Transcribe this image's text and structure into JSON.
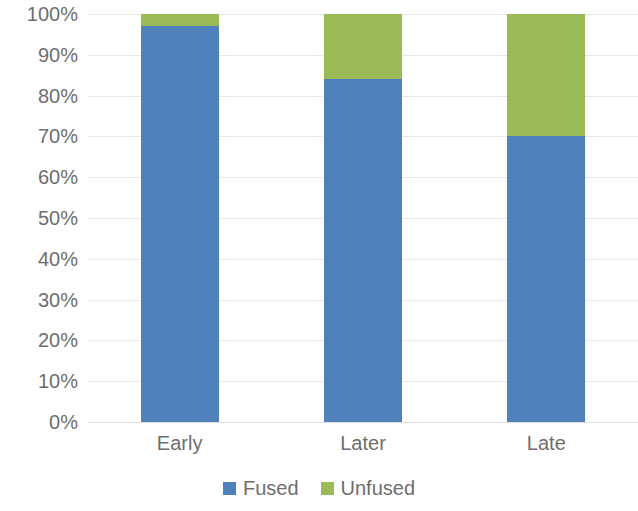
{
  "chart_data": {
    "type": "bar",
    "subtype": "stacked-percentage-column",
    "title": "",
    "subtitle": "",
    "xlabel": "",
    "ylabel": "",
    "categories": [
      "Early",
      "Later",
      "Late"
    ],
    "series": [
      {
        "name": "Fused",
        "color": "#4f81bd",
        "values": [
          97,
          84,
          70
        ]
      },
      {
        "name": "Unfused",
        "color": "#9bbb59",
        "values": [
          3,
          16,
          30
        ]
      }
    ],
    "ylim": [
      0,
      100
    ],
    "y_ticks": [
      0,
      10,
      20,
      30,
      40,
      50,
      60,
      70,
      80,
      90,
      100
    ],
    "y_tick_labels": [
      "0%",
      "10%",
      "20%",
      "30%",
      "40%",
      "50%",
      "60%",
      "70%",
      "80%",
      "90%",
      "100%"
    ],
    "grid": true,
    "grid_color": "#e8e8e8",
    "legend": [
      "Fused",
      "Unfused"
    ],
    "legend_position": "bottom",
    "annotations": [],
    "background_color": "#ffffff",
    "axis_text_color": "#6e6e6e"
  }
}
